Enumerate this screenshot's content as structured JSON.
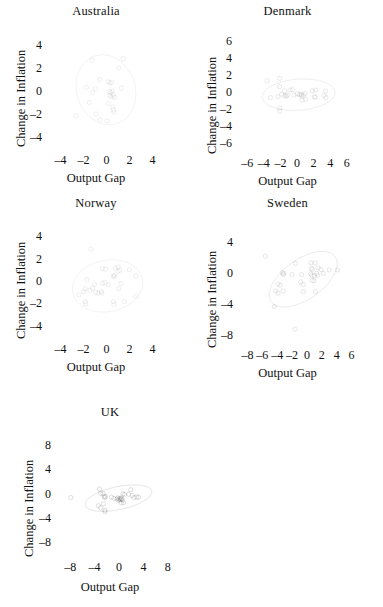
{
  "figure": {
    "axis_x_label": "Output Gap",
    "axis_y_label": "Change in Inflation"
  },
  "chart_data": [
    {
      "type": "scatter",
      "title": "Australia",
      "xlabel": "Output Gap",
      "ylabel": "Change in Inflation",
      "xlim": [
        -5,
        5
      ],
      "ylim": [
        -5,
        5
      ],
      "xticks": [
        -4,
        -2,
        0,
        2,
        4
      ],
      "xtick_labels": [
        "–4",
        "–2",
        "0",
        "2",
        "4"
      ],
      "yticks": [
        -4,
        -2,
        0,
        2,
        4
      ],
      "ytick_labels": [
        "–4",
        "–2",
        "0",
        "2",
        "4"
      ],
      "grid": false,
      "legend": "none",
      "ellipse": {
        "cx": -0.05,
        "cy": 0.15,
        "rx": 2.55,
        "ry": 3.1,
        "angle": -18
      },
      "points": [
        [
          -1.25,
          2.7
        ],
        [
          1.45,
          2.85
        ],
        [
          1.05,
          2.05
        ],
        [
          -0.6,
          1.05
        ],
        [
          0.15,
          0.85
        ],
        [
          0.3,
          0.75
        ],
        [
          0.45,
          0.8
        ],
        [
          -1.75,
          0.35
        ],
        [
          -1.2,
          -0.1
        ],
        [
          -0.95,
          0.25
        ],
        [
          1.3,
          0.3
        ],
        [
          0.25,
          0.0
        ],
        [
          0.4,
          -0.1
        ],
        [
          0.5,
          0.05
        ],
        [
          0.3,
          -0.35
        ],
        [
          0.45,
          -0.45
        ],
        [
          0.6,
          -0.3
        ],
        [
          0.7,
          -0.5
        ],
        [
          -1.5,
          -0.95
        ],
        [
          0.15,
          -1.05
        ],
        [
          0.55,
          -1.35
        ],
        [
          0.6,
          -1.6
        ],
        [
          0.65,
          -1.8
        ],
        [
          -2.65,
          -2.1
        ],
        [
          -0.9,
          -1.95
        ],
        [
          -0.55,
          -2.45
        ],
        [
          0.05,
          -2.55
        ]
      ]
    },
    {
      "type": "scatter",
      "title": "Denmark",
      "xlabel": "Output Gap",
      "ylabel": "Change in Inflation",
      "xlim": [
        -7,
        7
      ],
      "ylim": [
        -7,
        7
      ],
      "xticks": [
        -6,
        -4,
        -2,
        0,
        2,
        4,
        6
      ],
      "xtick_labels": [
        "–6",
        "–4",
        "–2",
        "0",
        "2",
        "4",
        "6"
      ],
      "yticks": [
        -6,
        -4,
        -2,
        0,
        2,
        4,
        6
      ],
      "ytick_labels": [
        "–6",
        "–4",
        "–2",
        "0",
        "2",
        "4",
        "6"
      ],
      "grid": false,
      "legend": "none",
      "ellipse": {
        "cx": 0.2,
        "cy": -0.2,
        "rx": 4.4,
        "ry": 1.85,
        "angle": -4
      },
      "points": [
        [
          -3.6,
          1.45
        ],
        [
          -2.1,
          1.75
        ],
        [
          -2.1,
          0.75
        ],
        [
          -1.5,
          0.25
        ],
        [
          -0.85,
          0.35
        ],
        [
          -0.55,
          0.4
        ],
        [
          -3.2,
          -0.55
        ],
        [
          -2.3,
          -0.45
        ],
        [
          -1.85,
          -0.15
        ],
        [
          -1.45,
          -0.3
        ],
        [
          -1.3,
          -0.4
        ],
        [
          -1.15,
          -0.25
        ],
        [
          -0.35,
          -0.25
        ],
        [
          0.05,
          -0.1
        ],
        [
          0.3,
          -0.2
        ],
        [
          0.5,
          -0.15
        ],
        [
          0.55,
          -0.35
        ],
        [
          0.75,
          -0.25
        ],
        [
          0.95,
          -0.05
        ],
        [
          0.6,
          -0.85
        ],
        [
          1.05,
          -0.75
        ],
        [
          1.85,
          0.25
        ],
        [
          2.25,
          0.35
        ],
        [
          2.1,
          -0.45
        ],
        [
          2.2,
          -0.5
        ],
        [
          3.25,
          -0.3
        ],
        [
          3.45,
          0.25
        ],
        [
          3.5,
          -0.55
        ],
        [
          -2.1,
          -1.8
        ],
        [
          -2.1,
          -2.15
        ]
      ]
    },
    {
      "type": "scatter",
      "title": "Norway",
      "xlabel": "Output Gap",
      "ylabel": "Change in Inflation",
      "xlim": [
        -5,
        5
      ],
      "ylim": [
        -5,
        5
      ],
      "xticks": [
        -4,
        -2,
        0,
        2,
        4
      ],
      "xtick_labels": [
        "–4",
        "–2",
        "0",
        "2",
        "4"
      ],
      "yticks": [
        -4,
        -2,
        0,
        2,
        4
      ],
      "ytick_labels": [
        "–4",
        "–2",
        "0",
        "2",
        "4"
      ],
      "grid": false,
      "legend": "none",
      "ellipse": {
        "cx": 0.1,
        "cy": -0.35,
        "rx": 3.1,
        "ry": 2.3,
        "angle": -12
      },
      "points": [
        [
          -1.35,
          2.95
        ],
        [
          -0.35,
          1.2
        ],
        [
          -0.1,
          1.15
        ],
        [
          0.75,
          1.25
        ],
        [
          1.0,
          1.35
        ],
        [
          1.0,
          0.95
        ],
        [
          1.15,
          1.05
        ],
        [
          2.0,
          1.1
        ],
        [
          0.6,
          0.55
        ],
        [
          0.7,
          0.6
        ],
        [
          0.65,
          0.45
        ],
        [
          2.55,
          0.55
        ],
        [
          -1.7,
          0.2
        ],
        [
          -1.05,
          -0.2
        ],
        [
          -0.35,
          -0.1
        ],
        [
          -0.15,
          -0.05
        ],
        [
          0.15,
          -0.25
        ],
        [
          1.25,
          -0.15
        ],
        [
          -1.85,
          -0.6
        ],
        [
          -2.0,
          -0.85
        ],
        [
          -1.45,
          -0.75
        ],
        [
          -1.2,
          -0.55
        ],
        [
          -0.95,
          -0.9
        ],
        [
          -0.75,
          -1.0
        ],
        [
          -0.45,
          -0.85
        ],
        [
          -0.4,
          -1.0
        ],
        [
          1.05,
          -0.6
        ],
        [
          -2.4,
          -1.15
        ],
        [
          2.55,
          -1.25
        ],
        [
          -1.85,
          -1.75
        ],
        [
          -1.8,
          -1.95
        ],
        [
          0.6,
          -1.75
        ],
        [
          0.65,
          -2.0
        ],
        [
          1.55,
          -1.75
        ]
      ]
    },
    {
      "type": "scatter",
      "title": "Sweden",
      "xlabel": "Output Gap",
      "ylabel": "Change in Inflation",
      "xlim": [
        -9,
        7
      ],
      "ylim": [
        -9,
        6
      ],
      "xticks": [
        -8,
        -6,
        -4,
        -2,
        0,
        2,
        4,
        6
      ],
      "xtick_labels": [
        "–8",
        "–6",
        "–4",
        "–2",
        "0",
        "2",
        "4",
        "6"
      ],
      "yticks": [
        -8,
        -4,
        0,
        4
      ],
      "ytick_labels": [
        "–8",
        "–4",
        "0",
        "4"
      ],
      "grid": false,
      "legend": "none",
      "ellipse": {
        "cx": -0.5,
        "cy": -0.7,
        "rx": 5.2,
        "ry": 2.6,
        "angle": -33
      },
      "points": [
        [
          -5.6,
          2.25
        ],
        [
          -1.55,
          1.35
        ],
        [
          0.55,
          1.4
        ],
        [
          1.1,
          1.4
        ],
        [
          0.6,
          0.7
        ],
        [
          0.75,
          0.55
        ],
        [
          1.5,
          0.75
        ],
        [
          1.9,
          0.55
        ],
        [
          3.0,
          0.5
        ],
        [
          4.1,
          0.5
        ],
        [
          -3.3,
          0.15
        ],
        [
          -3.2,
          -0.1
        ],
        [
          -3.1,
          0.05
        ],
        [
          -2.0,
          -0.1
        ],
        [
          -0.7,
          -0.1
        ],
        [
          0.5,
          0.0
        ],
        [
          0.65,
          -0.2
        ],
        [
          1.0,
          -0.25
        ],
        [
          1.3,
          0.05
        ],
        [
          1.45,
          -0.2
        ],
        [
          2.2,
          0.05
        ],
        [
          0.7,
          -0.85
        ],
        [
          0.95,
          -0.9
        ],
        [
          -3.9,
          -1.3
        ],
        [
          -3.6,
          -1.45
        ],
        [
          -0.85,
          -1.05
        ],
        [
          -0.5,
          -1.35
        ],
        [
          -4.2,
          -2.2
        ],
        [
          -3.9,
          -2.5
        ],
        [
          -3.2,
          -2.2
        ],
        [
          -0.5,
          -2.3
        ],
        [
          1.15,
          -2.3
        ],
        [
          -4.4,
          -4.2
        ],
        [
          -1.6,
          -7.1
        ]
      ]
    },
    {
      "type": "scatter",
      "title": "UK",
      "xlabel": "Output Gap",
      "ylabel": "Change in Inflation",
      "xlim": [
        -10,
        10
      ],
      "ylim": [
        -10,
        10
      ],
      "xticks": [
        -8,
        -4,
        0,
        4,
        8
      ],
      "xtick_labels": [
        "–8",
        "–4",
        "0",
        "4",
        "8"
      ],
      "yticks": [
        -8,
        -4,
        0,
        4,
        8
      ],
      "ytick_labels": [
        "–8",
        "–4",
        "0",
        "4",
        "8"
      ],
      "grid": false,
      "legend": "none",
      "ellipse": {
        "cx": -0.1,
        "cy": -0.6,
        "rx": 5.6,
        "ry": 1.9,
        "angle": -12
      },
      "points": [
        [
          -7.9,
          -0.5
        ],
        [
          -3.2,
          0.9
        ],
        [
          -3.0,
          0.2
        ],
        [
          -2.6,
          0.15
        ],
        [
          -2.45,
          -0.3
        ],
        [
          -2.35,
          -0.5
        ],
        [
          -2.2,
          -0.35
        ],
        [
          -1.25,
          -0.45
        ],
        [
          -0.85,
          -0.65
        ],
        [
          -0.35,
          -0.75
        ],
        [
          -0.2,
          -0.55
        ],
        [
          -0.1,
          -0.95
        ],
        [
          0.05,
          -0.7
        ],
        [
          0.15,
          -0.9
        ],
        [
          0.25,
          -0.6
        ],
        [
          0.35,
          -0.8
        ],
        [
          0.45,
          -0.65
        ],
        [
          0.55,
          -0.9
        ],
        [
          0.35,
          -1.35
        ],
        [
          0.75,
          -1.35
        ],
        [
          0.65,
          0.1
        ],
        [
          0.9,
          0.0
        ],
        [
          1.6,
          0.05
        ],
        [
          1.9,
          0.8
        ],
        [
          2.15,
          -0.15
        ],
        [
          2.45,
          -0.5
        ],
        [
          2.9,
          -0.4
        ],
        [
          3.2,
          -0.45
        ],
        [
          -3.4,
          -1.85
        ],
        [
          -3.0,
          -2.2
        ],
        [
          -2.55,
          -1.55
        ],
        [
          -2.3,
          -2.6
        ],
        [
          -2.3,
          -2.85
        ]
      ]
    }
  ]
}
